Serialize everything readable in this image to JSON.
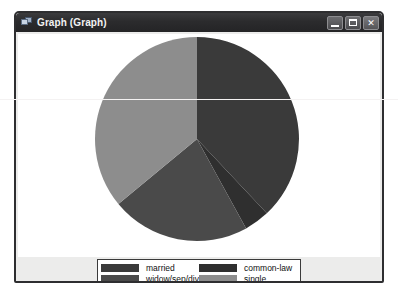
{
  "window": {
    "title": "Graph (Graph)",
    "icon": "graph-window-icon",
    "controls": {
      "minimize": "_",
      "maximize": "□",
      "close": "✕"
    }
  },
  "chart_data": {
    "type": "pie",
    "title": "",
    "categories": [
      "married",
      "common-law",
      "widow/sep/div",
      "single"
    ],
    "values": [
      38,
      4,
      22,
      36
    ],
    "unit": "percent",
    "start_angle": 0,
    "direction": "clockwise",
    "colors": [
      "#3a3a3a",
      "#2f2f2f",
      "#4a4a4a",
      "#8d8d8d"
    ],
    "legend_position": "bottom",
    "grid": false
  },
  "legend": {
    "items": [
      {
        "label": "married",
        "color": "#3a3a3a"
      },
      {
        "label": "common-law",
        "color": "#2f2f2f"
      },
      {
        "label": "widow/sep/div",
        "color": "#4a4a4a"
      },
      {
        "label": "single",
        "color": "#8d8d8d"
      }
    ]
  }
}
